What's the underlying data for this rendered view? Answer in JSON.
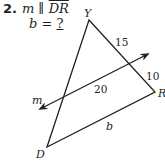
{
  "problem": {
    "number": "2.",
    "given_var": "m",
    "parallel_symbol": "∥",
    "given_segment": "DR",
    "unknown_var": "b",
    "equals": "=",
    "unknown_value": "?"
  },
  "figure": {
    "vertices": {
      "Y": {
        "label": "Y",
        "x": 89,
        "y": 20
      },
      "R": {
        "label": "R",
        "x": 155,
        "y": 92
      },
      "D": {
        "label": "D",
        "x": 47,
        "y": 147
      }
    },
    "line_m": {
      "label": "m",
      "tail": {
        "x": 40,
        "y": 109
      },
      "head": {
        "x": 148,
        "y": 54
      }
    },
    "segment_labels": {
      "upper_YR": "15",
      "lower_YR": "10",
      "parallel_segment": "20",
      "DR": "b"
    },
    "stroke_color": "#231f20"
  }
}
